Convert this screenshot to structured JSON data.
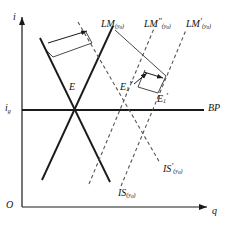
{
  "figure": {
    "type": "economics-diagram",
    "name": "IS-LM-BP Mundell-Fleming diagram",
    "background_color": "#ffffff",
    "line_color": "#1a1a1a",
    "dashed_color": "#555555"
  },
  "axes": {
    "vertical_label": "i",
    "horizontal_label": "q",
    "origin_label": "O",
    "interest_level_label": "i",
    "interest_level_subscript": "g",
    "bp_label": "BP"
  },
  "curves": [
    {
      "id": "is-original",
      "base": "IS",
      "prime": "",
      "subscript": "y",
      "sub_subscript": "0",
      "style": "solid",
      "label_x": 118,
      "label_y": 186
    },
    {
      "id": "is-shifted",
      "base": "IS",
      "prime": "′",
      "subscript": "y",
      "sub_subscript": "0",
      "style": "dashed",
      "label_x": 163,
      "label_y": 162
    },
    {
      "id": "lm-original",
      "base": "LM",
      "prime": "",
      "subscript": "y",
      "sub_subscript": "0",
      "style": "solid",
      "label_x": 101,
      "label_y": 17
    },
    {
      "id": "lm-double-prime",
      "base": "LM",
      "prime": "″",
      "subscript": "y",
      "sub_subscript": "0",
      "style": "dashed",
      "label_x": 144,
      "label_y": 17
    },
    {
      "id": "lm-prime",
      "base": "LM",
      "prime": "′",
      "subscript": "y",
      "sub_subscript": "0",
      "style": "dashed",
      "label_x": 186,
      "label_y": 17
    }
  ],
  "points": [
    {
      "id": "equilibrium-e",
      "base": "E",
      "subscript": "",
      "prime": "",
      "label_x": 69,
      "label_y": 80,
      "cx": 75,
      "cy": 110
    },
    {
      "id": "equilibrium-e1-double-prime",
      "base": "E",
      "subscript": "1",
      "prime": "″",
      "label_x": 120,
      "label_y": 80,
      "cx": 128,
      "cy": 110
    },
    {
      "id": "equilibrium-e1-prime",
      "base": "E",
      "subscript": "1",
      "prime": "′",
      "label_x": 157,
      "label_y": 92,
      "cx": 160,
      "cy": 110
    }
  ],
  "annotations": {
    "arrow_is_shift": "IS shift arrow",
    "arrow_lm_shift_upper": "LM shift arrow upper",
    "arrow_lm_shift_lower": "LM shift arrow lower"
  }
}
